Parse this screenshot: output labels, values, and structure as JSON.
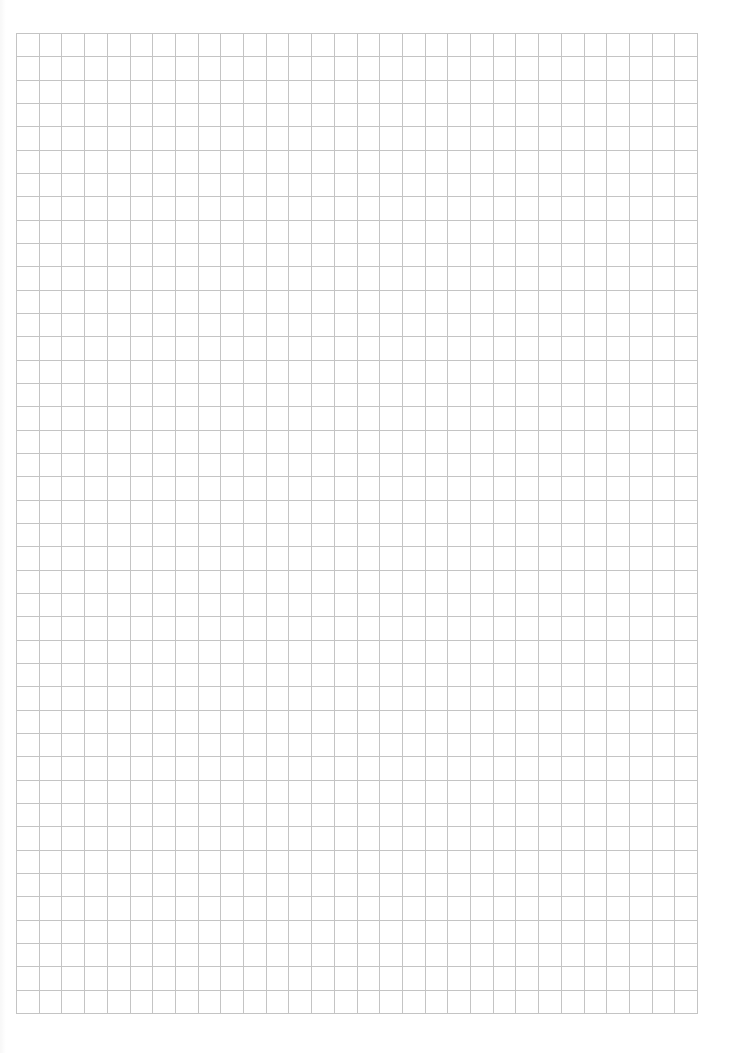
{
  "page": {
    "type": "grid-paper",
    "background_color": "#ffffff"
  },
  "grid": {
    "left": 16,
    "top": 33,
    "width": 681,
    "height": 980,
    "columns": 30,
    "rows": 42,
    "line_color": "#c4c4c4",
    "line_width": 1
  }
}
